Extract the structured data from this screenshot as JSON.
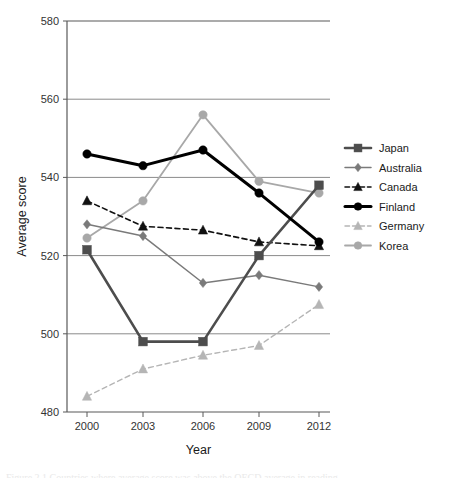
{
  "chart_data": {
    "type": "line",
    "title": "",
    "xlabel": "Year",
    "ylabel": "Average score",
    "categories": [
      "2000",
      "2003",
      "2006",
      "2009",
      "2012"
    ],
    "x": [
      2000,
      2003,
      2006,
      2009,
      2012
    ],
    "xlim": [
      1998.5,
      2013.5
    ],
    "ylim": [
      480,
      580
    ],
    "yticks": [
      "480",
      "500",
      "520",
      "540",
      "560",
      "580"
    ],
    "ytick_values": [
      480,
      500,
      520,
      540,
      560,
      580
    ],
    "grid": "horizontal",
    "legend_position": "right",
    "series": [
      {
        "name": "Japan",
        "values": [
          521.5,
          498,
          498,
          520,
          538
        ],
        "color": "#4d4d4d",
        "marker": "square",
        "dash": "solid",
        "width": 2.6
      },
      {
        "name": "Australia",
        "values": [
          528,
          525,
          513,
          515,
          512
        ],
        "color": "#7a7a7a",
        "marker": "diamond",
        "dash": "solid",
        "width": 1.5
      },
      {
        "name": "Canada",
        "values": [
          534,
          527.5,
          526.5,
          523.5,
          522.5
        ],
        "color": "#111111",
        "marker": "triangle",
        "dash": "dashed",
        "width": 1.6
      },
      {
        "name": "Finland",
        "values": [
          546,
          543,
          547,
          536,
          523.5
        ],
        "color": "#000000",
        "marker": "circle",
        "dash": "solid",
        "width": 3.0
      },
      {
        "name": "Germany",
        "values": [
          484,
          491,
          494.5,
          497,
          507.5
        ],
        "color": "#b5b5b5",
        "marker": "triangle",
        "dash": "dashed",
        "width": 1.4
      },
      {
        "name": "Korea",
        "values": [
          524.5,
          534,
          556,
          539,
          536
        ],
        "color": "#a8a8a8",
        "marker": "circle",
        "dash": "solid",
        "width": 1.8
      }
    ]
  },
  "caption": {
    "text": "Figure 2.1 Countries where average score was above the OECD average in reading"
  }
}
